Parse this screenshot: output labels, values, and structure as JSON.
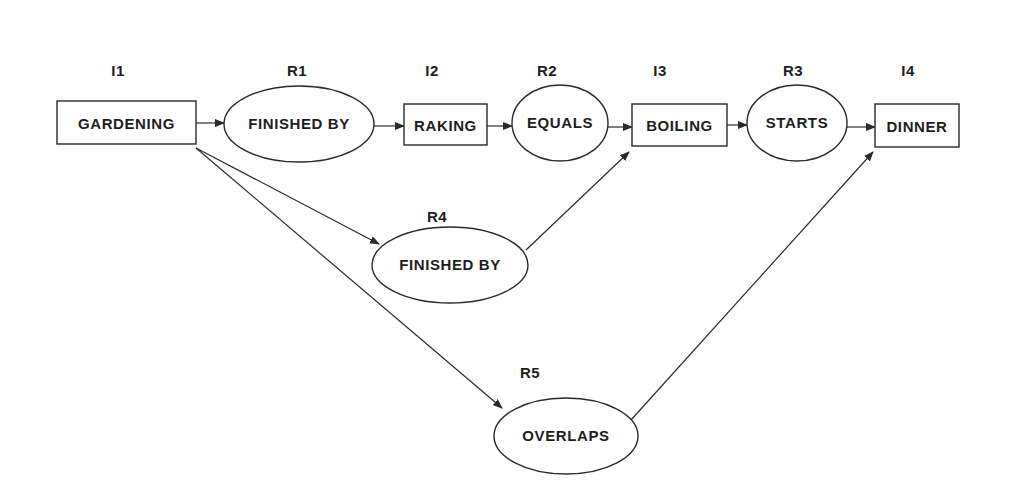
{
  "diagram": {
    "type": "interval-relation-graph",
    "column_labels": [
      {
        "id": "I1",
        "x": 118,
        "y": 76
      },
      {
        "id": "R1",
        "x": 297,
        "y": 76
      },
      {
        "id": "I2",
        "x": 432,
        "y": 76
      },
      {
        "id": "R2",
        "x": 547,
        "y": 76
      },
      {
        "id": "I3",
        "x": 660,
        "y": 76
      },
      {
        "id": "R3",
        "x": 793,
        "y": 76
      },
      {
        "id": "I4",
        "x": 908,
        "y": 76
      },
      {
        "id": "R4",
        "x": 437,
        "y": 222
      },
      {
        "id": "R5",
        "x": 530,
        "y": 378
      }
    ],
    "intervals": [
      {
        "id": "I1",
        "label": "GARDENING",
        "x": 57,
        "y": 101,
        "w": 139,
        "h": 43
      },
      {
        "id": "I2",
        "label": "RAKING",
        "x": 404,
        "y": 104,
        "w": 83,
        "h": 41
      },
      {
        "id": "I3",
        "label": "BOILING",
        "x": 632,
        "y": 104,
        "w": 95,
        "h": 42
      },
      {
        "id": "I4",
        "label": "DINNER",
        "x": 875,
        "y": 104,
        "w": 84,
        "h": 43
      }
    ],
    "relations": [
      {
        "id": "R1",
        "label": "FINISHED BY",
        "cx": 299,
        "cy": 124,
        "rx": 75,
        "ry": 38
      },
      {
        "id": "R2",
        "label": "EQUALS",
        "cx": 560,
        "cy": 123,
        "rx": 48,
        "ry": 38
      },
      {
        "id": "R3",
        "label": "STARTS",
        "cx": 797,
        "cy": 123,
        "rx": 50,
        "ry": 38
      },
      {
        "id": "R4",
        "label": "FINISHED BY",
        "cx": 450,
        "cy": 265,
        "rx": 78,
        "ry": 38
      },
      {
        "id": "R5",
        "label": "OVERLAPS",
        "cx": 566,
        "cy": 436,
        "rx": 72,
        "ry": 38
      }
    ],
    "edges": [
      {
        "from": "I1",
        "to": "R1",
        "x1": 196,
        "y1": 123,
        "x2": 224,
        "y2": 123
      },
      {
        "from": "R1",
        "to": "I2",
        "x1": 374,
        "y1": 126,
        "x2": 404,
        "y2": 126
      },
      {
        "from": "I2",
        "to": "R2",
        "x1": 487,
        "y1": 126,
        "x2": 512,
        "y2": 126
      },
      {
        "from": "R2",
        "to": "I3",
        "x1": 608,
        "y1": 127,
        "x2": 632,
        "y2": 127
      },
      {
        "from": "I3",
        "to": "R3",
        "x1": 727,
        "y1": 125,
        "x2": 747,
        "y2": 125
      },
      {
        "from": "R3",
        "to": "I4",
        "x1": 847,
        "y1": 127,
        "x2": 875,
        "y2": 127
      },
      {
        "from": "I1",
        "to": "R4",
        "x1": 196,
        "y1": 148,
        "x2": 379,
        "y2": 244
      },
      {
        "from": "R4",
        "to": "I3",
        "x1": 526,
        "y1": 250,
        "x2": 629,
        "y2": 152
      },
      {
        "from": "I1",
        "to": "R5",
        "x1": 196,
        "y1": 148,
        "x2": 502,
        "y2": 408
      },
      {
        "from": "R5",
        "to": "I4",
        "x1": 631,
        "y1": 420,
        "x2": 873,
        "y2": 152
      }
    ]
  }
}
